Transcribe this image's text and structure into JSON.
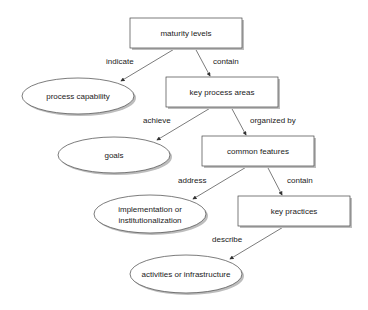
{
  "diagram": {
    "nodes": {
      "maturity_levels": {
        "label": "maturity levels",
        "shape": "rect"
      },
      "key_process_areas": {
        "label": "key process areas",
        "shape": "rect"
      },
      "common_features": {
        "label": "common features",
        "shape": "rect"
      },
      "key_practices": {
        "label": "key practices",
        "shape": "rect"
      },
      "process_capability": {
        "label": "process capability",
        "shape": "ellipse"
      },
      "goals": {
        "label": "goals",
        "shape": "ellipse"
      },
      "implementation": {
        "label_line1": "implementation or",
        "label_line2": "institutionalization",
        "shape": "ellipse"
      },
      "activities": {
        "label": "activities or infrastructure",
        "shape": "ellipse"
      }
    },
    "edges": {
      "indicate": {
        "label": "indicate",
        "from": "maturity levels",
        "to": "process capability"
      },
      "contain1": {
        "label": "contain",
        "from": "maturity levels",
        "to": "key process areas"
      },
      "achieve": {
        "label": "achieve",
        "from": "key process areas",
        "to": "goals"
      },
      "organized_by": {
        "label": "organized by",
        "from": "key process areas",
        "to": "common features"
      },
      "address": {
        "label": "address",
        "from": "common features",
        "to": "implementation or institutionalization"
      },
      "contain2": {
        "label": "contain",
        "from": "common features",
        "to": "key practices"
      },
      "describe": {
        "label": "describe",
        "from": "key practices",
        "to": "activities or infrastructure"
      }
    },
    "colors": {
      "stroke": "#333333",
      "shadow": "#b5b5b5",
      "fill": "#ffffff"
    }
  }
}
